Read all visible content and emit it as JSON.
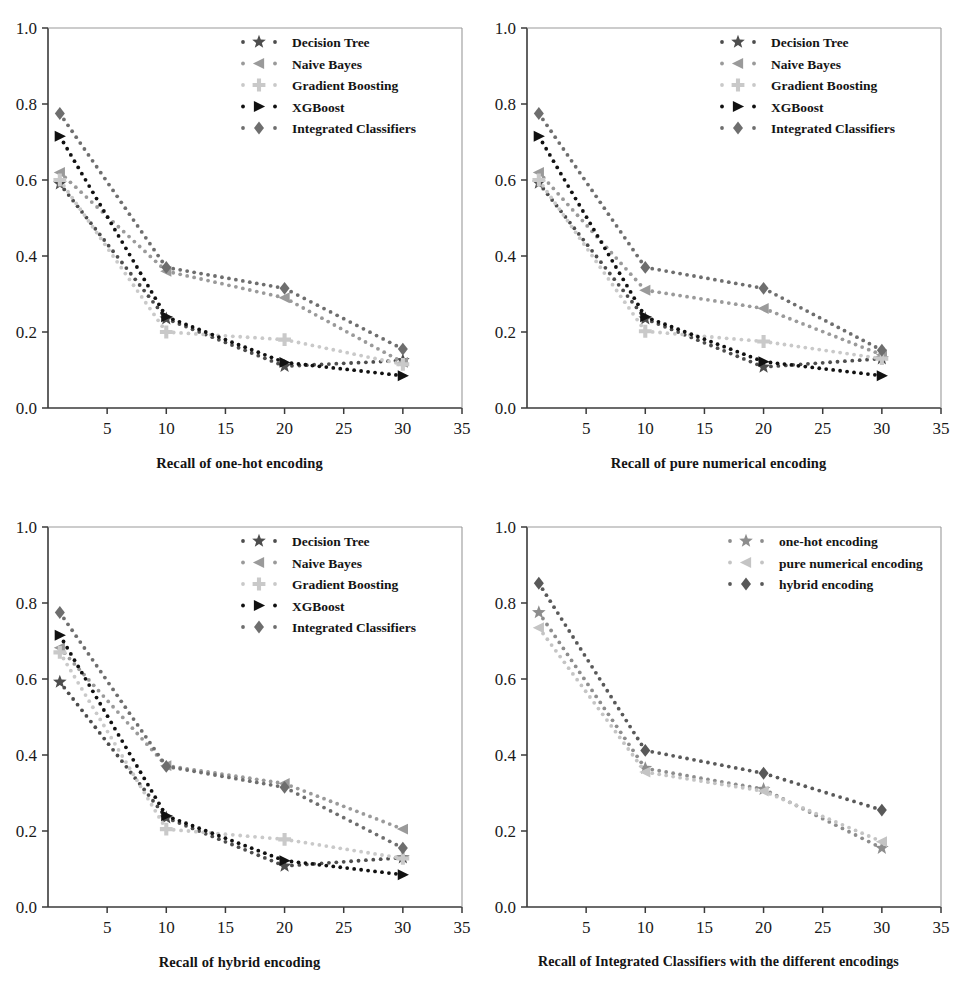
{
  "figure": {
    "background": "#ffffff",
    "panel_count": 4
  },
  "palette": {
    "decision_tree": "#4d4d4d",
    "naive_bayes": "#9a9a9a",
    "gradient_boosting": "#c9c9c9",
    "xgboost": "#111111",
    "integrated_classifiers": "#6e6e6e",
    "one_hot": "#8d8d8d",
    "pure_numerical": "#c4c4c4",
    "hybrid": "#595959",
    "axis": "#3a3a3a"
  },
  "axis_common": {
    "xticks": [
      5,
      10,
      15,
      20,
      25,
      30,
      35
    ],
    "xtick_labels": [
      "5",
      "10",
      "15",
      "20",
      "25",
      "30",
      "35"
    ],
    "yticks": [
      0.0,
      0.2,
      0.4,
      0.6,
      0.8,
      1.0
    ],
    "ytick_labels": [
      "0.0",
      "0.2",
      "0.4",
      "0.6",
      "0.8",
      "1.0"
    ],
    "xlim": [
      0,
      35
    ],
    "ylim": [
      0.0,
      1.0
    ],
    "grid": false
  },
  "chart_data": [
    {
      "id": "panel-one-hot",
      "type": "line",
      "title": "",
      "xlabel": "Recall of one-hot encoding",
      "ylabel": "",
      "xlim": [
        0,
        35
      ],
      "ylim": [
        0.0,
        1.0
      ],
      "grid": false,
      "legend_position": "upper right",
      "x": [
        1,
        10,
        20,
        30
      ],
      "series": [
        {
          "name": "Decision Tree",
          "marker": "star",
          "color": "#4d4d4d",
          "values": [
            0.59,
            0.235,
            0.11,
            0.125
          ]
        },
        {
          "name": "Naive Bayes",
          "marker": "triangle-left",
          "color": "#9a9a9a",
          "values": [
            0.62,
            0.36,
            0.29,
            0.12
          ]
        },
        {
          "name": "Gradient Boosting",
          "marker": "plus",
          "color": "#c9c9c9",
          "values": [
            0.6,
            0.2,
            0.18,
            0.115
          ]
        },
        {
          "name": "XGBoost",
          "marker": "triangle-right",
          "color": "#111111",
          "values": [
            0.715,
            0.24,
            0.12,
            0.085
          ]
        },
        {
          "name": "Integrated Classifiers",
          "marker": "diamond",
          "color": "#6e6e6e",
          "values": [
            0.775,
            0.37,
            0.315,
            0.155
          ]
        }
      ]
    },
    {
      "id": "panel-pure-numerical",
      "type": "line",
      "title": "",
      "xlabel": "Recall of pure numerical encoding",
      "ylabel": "",
      "xlim": [
        0,
        35
      ],
      "ylim": [
        0.0,
        1.0
      ],
      "grid": false,
      "legend_position": "upper right",
      "x": [
        1,
        10,
        20,
        30
      ],
      "series": [
        {
          "name": "Decision Tree",
          "marker": "star",
          "color": "#4d4d4d",
          "values": [
            0.592,
            0.235,
            0.108,
            0.13
          ]
        },
        {
          "name": "Naive Bayes",
          "marker": "triangle-left",
          "color": "#9a9a9a",
          "values": [
            0.62,
            0.31,
            0.262,
            0.14
          ]
        },
        {
          "name": "Gradient Boosting",
          "marker": "plus",
          "color": "#c9c9c9",
          "values": [
            0.6,
            0.202,
            0.175,
            0.13
          ]
        },
        {
          "name": "XGBoost",
          "marker": "triangle-right",
          "color": "#111111",
          "values": [
            0.715,
            0.24,
            0.122,
            0.085
          ]
        },
        {
          "name": "Integrated Classifiers",
          "marker": "diamond",
          "color": "#6e6e6e",
          "values": [
            0.775,
            0.37,
            0.315,
            0.152
          ]
        }
      ]
    },
    {
      "id": "panel-hybrid",
      "type": "line",
      "title": "",
      "xlabel": "Recall of hybrid encoding",
      "ylabel": "",
      "xlim": [
        0,
        35
      ],
      "ylim": [
        0.0,
        1.0
      ],
      "grid": false,
      "legend_position": "upper right",
      "x": [
        1,
        10,
        20,
        30
      ],
      "series": [
        {
          "name": "Decision Tree",
          "marker": "star",
          "color": "#4d4d4d",
          "values": [
            0.592,
            0.235,
            0.108,
            0.13
          ]
        },
        {
          "name": "Naive Bayes",
          "marker": "triangle-left",
          "color": "#9a9a9a",
          "values": [
            0.682,
            0.372,
            0.325,
            0.205
          ]
        },
        {
          "name": "Gradient Boosting",
          "marker": "plus",
          "color": "#c9c9c9",
          "values": [
            0.67,
            0.205,
            0.178,
            0.128
          ]
        },
        {
          "name": "XGBoost",
          "marker": "triangle-right",
          "color": "#111111",
          "values": [
            0.715,
            0.24,
            0.122,
            0.085
          ]
        },
        {
          "name": "Integrated Classifiers",
          "marker": "diamond",
          "color": "#6e6e6e",
          "values": [
            0.775,
            0.37,
            0.315,
            0.155
          ]
        }
      ]
    },
    {
      "id": "panel-integrated-comparison",
      "type": "line",
      "title": "",
      "xlabel": "Recall of Integrated Classifiers with the different encodings",
      "ylabel": "",
      "xlim": [
        0,
        35
      ],
      "ylim": [
        0.0,
        1.0
      ],
      "grid": false,
      "legend_position": "upper right",
      "x": [
        1,
        10,
        20,
        30
      ],
      "series": [
        {
          "name": "one-hot encoding",
          "marker": "star",
          "color": "#8d8d8d",
          "values": [
            0.775,
            0.365,
            0.31,
            0.155
          ]
        },
        {
          "name": "pure numerical encoding",
          "marker": "triangle-left",
          "color": "#c4c4c4",
          "values": [
            0.735,
            0.355,
            0.305,
            0.172
          ]
        },
        {
          "name": "hybrid encoding",
          "marker": "diamond",
          "color": "#595959",
          "values": [
            0.852,
            0.412,
            0.352,
            0.255
          ]
        }
      ]
    }
  ]
}
